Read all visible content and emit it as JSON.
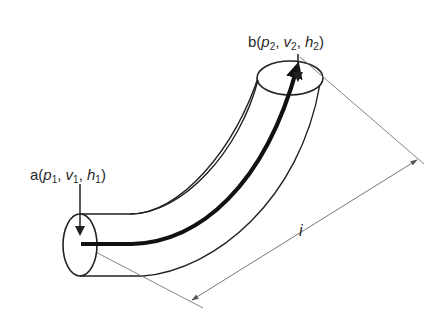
{
  "diagram": {
    "type": "fluid flow in curved pipe",
    "point_a": {
      "name": "a",
      "vars": [
        {
          "sym": "p",
          "sub": "1"
        },
        {
          "sym": "v",
          "sub": "1"
        },
        {
          "sym": "h",
          "sub": "1"
        }
      ]
    },
    "point_b": {
      "name": "b",
      "vars": [
        {
          "sym": "p",
          "sub": "2"
        },
        {
          "sym": "v",
          "sub": "2"
        },
        {
          "sym": "h",
          "sub": "2"
        }
      ]
    },
    "length_label": "i",
    "punct": {
      "open": "(",
      "close": ")",
      "sep": ", "
    },
    "colors": {
      "stroke": "#222222",
      "dimension": "#777777",
      "background": "#ffffff"
    }
  }
}
